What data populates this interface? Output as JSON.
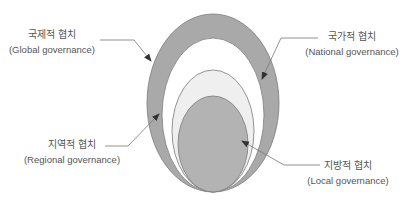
{
  "diagram": {
    "title": "",
    "layers": [
      {
        "id": "global",
        "ko": "국제적 협치",
        "en": "(Global governance)",
        "fill": "#a9a9a9"
      },
      {
        "id": "regional",
        "ko": "지역적 협치",
        "en": "(Regional governance)",
        "fill": "#ffffff"
      },
      {
        "id": "national",
        "ko": "국가적 협치",
        "en": "(National governance)",
        "fill": "#efefef"
      },
      {
        "id": "local",
        "ko": "지방적 협치",
        "en": "(Local governance)",
        "fill": "#b3b3b3"
      }
    ],
    "stroke": "#7a7a7a",
    "arrow_color": "#444444",
    "text_color": "#555555"
  }
}
